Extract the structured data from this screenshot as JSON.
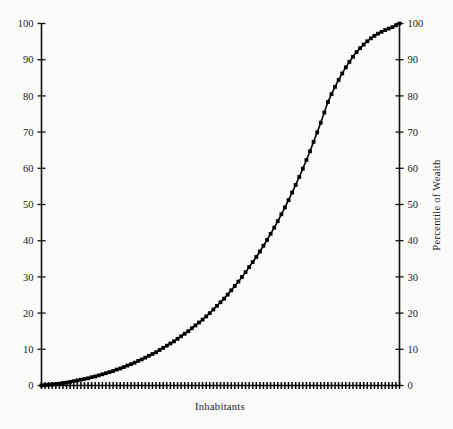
{
  "figure": {
    "background_color": "#fbfbfa",
    "ink_color": "#000000"
  },
  "chart_data": {
    "type": "line",
    "title": "",
    "subtitle": "",
    "xlabel": "Inhabitants",
    "ylabel": "",
    "ylabel_right": "Percentile of Wealth",
    "grid": false,
    "legend": "none",
    "xlim": [
      0,
      100
    ],
    "ylim": [
      0,
      100
    ],
    "x_tick_labels": [],
    "y_tick_labels": [
      "0",
      "10",
      "20",
      "30",
      "40",
      "50",
      "60",
      "70",
      "80",
      "90",
      "100"
    ],
    "y_tick_values": [
      0,
      10,
      20,
      30,
      40,
      50,
      60,
      70,
      80,
      90,
      100
    ],
    "y_tick_labels_right": [
      "0",
      "10",
      "20",
      "30",
      "40",
      "50",
      "60",
      "70",
      "80",
      "90",
      "100"
    ],
    "y_tick_values_right": [
      0,
      10,
      20,
      30,
      40,
      50,
      60,
      70,
      80,
      90,
      100
    ],
    "marker": "square",
    "rug_on_x_axis": true,
    "rug_tick_count": 100,
    "series": [
      {
        "name": "Cumulative wealth share",
        "x": [
          0,
          1,
          2,
          3,
          4,
          5,
          6,
          7,
          8,
          9,
          10,
          11,
          12,
          13,
          14,
          15,
          16,
          17,
          18,
          19,
          20,
          21,
          22,
          23,
          24,
          25,
          26,
          27,
          28,
          29,
          30,
          31,
          32,
          33,
          34,
          35,
          36,
          37,
          38,
          39,
          40,
          41,
          42,
          43,
          44,
          45,
          46,
          47,
          48,
          49,
          50,
          51,
          52,
          53,
          54,
          55,
          56,
          57,
          58,
          59,
          60,
          61,
          62,
          63,
          64,
          65,
          66,
          67,
          68,
          69,
          70,
          71,
          72,
          73,
          74,
          75,
          76,
          77,
          78,
          79,
          80,
          81,
          82,
          83,
          84,
          85,
          86,
          87,
          88,
          89,
          90,
          91,
          92,
          93,
          94,
          95,
          96,
          97,
          98,
          99,
          100
        ],
        "y": [
          0,
          0.1,
          0.2,
          0.3,
          0.4,
          0.5,
          0.7,
          0.8,
          1.0,
          1.2,
          1.4,
          1.6,
          1.8,
          2.0,
          2.3,
          2.5,
          2.8,
          3.1,
          3.4,
          3.7,
          4.0,
          4.4,
          4.7,
          5.1,
          5.5,
          5.9,
          6.3,
          6.8,
          7.2,
          7.7,
          8.2,
          8.7,
          9.2,
          9.8,
          10.4,
          11.0,
          11.6,
          12.2,
          12.9,
          13.6,
          14.3,
          15.0,
          15.8,
          16.6,
          17.4,
          18.2,
          19.1,
          20.0,
          21.0,
          22.0,
          23.0,
          24.0,
          25.1,
          26.3,
          27.5,
          28.7,
          30.0,
          31.3,
          32.7,
          34.1,
          35.5,
          37.0,
          38.6,
          40.2,
          41.9,
          43.6,
          45.4,
          47.3,
          49.2,
          51.2,
          53.3,
          55.4,
          57.6,
          59.9,
          62.3,
          64.7,
          67.3,
          69.9,
          72.6,
          75.4,
          78.3,
          80.5,
          82.5,
          84.4,
          86.2,
          87.9,
          89.4,
          90.8,
          92.1,
          93.2,
          94.2,
          95.1,
          95.9,
          96.6,
          97.2,
          97.7,
          98.2,
          98.6,
          99.0,
          99.5,
          100
        ]
      }
    ]
  },
  "axes": {
    "left_axis_name": "left-y-axis",
    "right_axis_name": "right-y-axis",
    "bottom_axis_name": "x-axis"
  }
}
